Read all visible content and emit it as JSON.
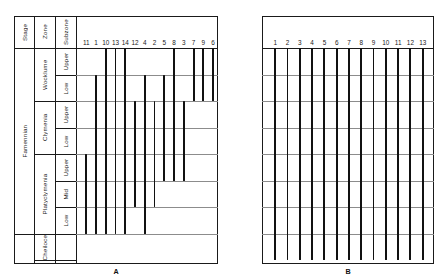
{
  "figure": {
    "panels": [
      {
        "key": "A",
        "label": "A"
      },
      {
        "key": "B",
        "label": "B"
      }
    ]
  },
  "header": {
    "stage_label": "Stage",
    "zone_label": "Zone",
    "subzone_label": "Subzone"
  },
  "stage": {
    "name": "Famennian"
  },
  "zones": [
    {
      "name": "Wocklume",
      "subzones": [
        "Upper",
        "Low"
      ]
    },
    {
      "name": "Clymenia",
      "subzones": [
        "Upper",
        "Low"
      ]
    },
    {
      "name": "Platyclymenia",
      "subzones": [
        "Upper",
        "Mid",
        "Low"
      ]
    },
    {
      "name": "Cheiloce",
      "subzones": []
    }
  ],
  "chart_data": {
    "type": "bar",
    "title": "",
    "xlabel": "",
    "ylabel": "",
    "orientation": "vertical-ranges",
    "grid": true,
    "y_categories": [
      "Wocklume Upper",
      "Wocklume Low",
      "Clymenia Upper",
      "Clymenia Low",
      "Platyclymenia Upper",
      "Platyclymenia Mid",
      "Platyclymenia Low",
      "Cheiloce"
    ],
    "panels": [
      {
        "name": "A",
        "categories": [
          "11",
          "1",
          "10",
          "13",
          "14",
          "12",
          "4",
          "2",
          "5",
          "8",
          "3",
          "7",
          "9",
          "6"
        ],
        "ranges": [
          {
            "label": "11",
            "top_level": 5,
            "bottom_level": 7
          },
          {
            "label": "1",
            "top_level": 2,
            "bottom_level": 7
          },
          {
            "label": "10",
            "top_level": 1,
            "bottom_level": 7
          },
          {
            "label": "13",
            "top_level": 1,
            "bottom_level": 7
          },
          {
            "label": "14",
            "top_level": 1,
            "bottom_level": 7
          },
          {
            "label": "12",
            "top_level": 3,
            "bottom_level": 6
          },
          {
            "label": "4",
            "top_level": 2,
            "bottom_level": 7
          },
          {
            "label": "2",
            "top_level": 3,
            "bottom_level": 6
          },
          {
            "label": "5",
            "top_level": 2,
            "bottom_level": 5
          },
          {
            "label": "8",
            "top_level": 1,
            "bottom_level": 5
          },
          {
            "label": "3",
            "top_level": 3,
            "bottom_level": 5
          },
          {
            "label": "7",
            "top_level": 1,
            "bottom_level": 2
          },
          {
            "label": "9",
            "top_level": 1,
            "bottom_level": 2
          },
          {
            "label": "6",
            "top_level": 1,
            "bottom_level": 2
          }
        ]
      },
      {
        "name": "B",
        "categories": [
          "1",
          "2",
          "3",
          "4",
          "5",
          "6",
          "7",
          "8",
          "9",
          "10",
          "11",
          "12",
          "13"
        ],
        "ranges": [
          {
            "label": "1",
            "top_level": 1,
            "bottom_level": 8
          },
          {
            "label": "2",
            "top_level": 1,
            "bottom_level": 8
          },
          {
            "label": "3",
            "top_level": 1,
            "bottom_level": 8
          },
          {
            "label": "4",
            "top_level": 1,
            "bottom_level": 8
          },
          {
            "label": "5",
            "top_level": 1,
            "bottom_level": 8
          },
          {
            "label": "6",
            "top_level": 1,
            "bottom_level": 8
          },
          {
            "label": "7",
            "top_level": 1,
            "bottom_level": 8
          },
          {
            "label": "8",
            "top_level": 1,
            "bottom_level": 8
          },
          {
            "label": "9",
            "top_level": 1,
            "bottom_level": 8
          },
          {
            "label": "10",
            "top_level": 1,
            "bottom_level": 8
          },
          {
            "label": "11",
            "top_level": 1,
            "bottom_level": 8
          },
          {
            "label": "12",
            "top_level": 1,
            "bottom_level": 8
          },
          {
            "label": "13",
            "top_level": 1,
            "bottom_level": 8
          }
        ]
      }
    ]
  },
  "colors": {
    "bar": "#111111",
    "frame": "#1a1a1a",
    "gridline": "#8c8c8c",
    "background": "#ffffff"
  }
}
